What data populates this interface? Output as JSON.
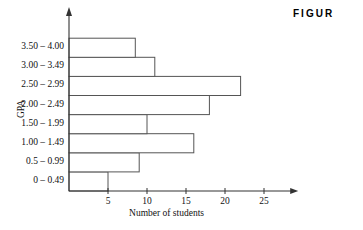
{
  "figure_caption": "FIGUR",
  "chart_data": {
    "type": "bar",
    "orientation": "horizontal",
    "title": "",
    "xlabel": "Number of students",
    "ylabel": "GPA",
    "categories": [
      "0 – 0.49",
      "0.5 – 0.99",
      "1.00 – 1.49",
      "1.50 – 1.99",
      "2.00 – 2.49",
      "2.50 – 2.99",
      "3.00 – 3.49",
      "3.50 – 4.00"
    ],
    "values": [
      5,
      9,
      16,
      10,
      18,
      22,
      11,
      8.5
    ],
    "xlim": [
      0,
      29
    ],
    "xticks": [
      5,
      10,
      15,
      20,
      25
    ],
    "xtick_labels": [
      "5",
      "10",
      "15",
      "20",
      "25"
    ],
    "grid": false,
    "legend": false,
    "bar_fill": "#ffffff",
    "bar_stroke": "#555555",
    "axis_color": "#333333"
  }
}
